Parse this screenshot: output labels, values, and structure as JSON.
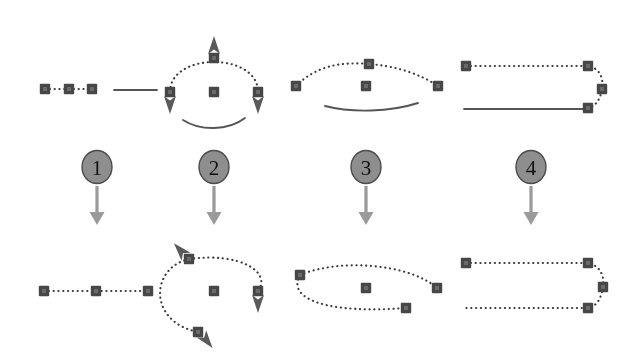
{
  "figure": {
    "type": "diagram",
    "width": 635,
    "height": 353,
    "background": "#ffffff",
    "rows": [
      "before",
      "after"
    ],
    "columns": 4
  },
  "colors": {
    "node": "#474747",
    "node_inner": "#6a6a6a",
    "dotted_path": "#3a3a3a",
    "solid_path": "#555555",
    "arrow": "#9a9a9a",
    "marker_arrow": "#5a5a5a",
    "circle_fill": "#8e8e8e",
    "circle_stroke": "#4b4b4b",
    "number_text": "#111111"
  },
  "steps": [
    {
      "id": "step-1",
      "label": "1",
      "circle": {
        "cx": 97,
        "cy": 167,
        "r": 15
      },
      "arrow": {
        "x": 97,
        "y1": 186,
        "y2": 225
      },
      "before": {
        "description": "three nodes joined by dotted segments plus a separate solid segment",
        "nodes": [
          {
            "x": 45,
            "y": 89
          },
          {
            "x": 69,
            "y": 89
          },
          {
            "x": 92,
            "y": 89
          }
        ],
        "dotted_paths": [
          "M45 89 L92 89"
        ],
        "solid_paths": [
          "M114 90 L157 90"
        ]
      },
      "after": {
        "description": "three nodes joined into one continuous dotted path",
        "nodes": [
          {
            "x": 44,
            "y": 291
          },
          {
            "x": 96,
            "y": 291
          },
          {
            "x": 148,
            "y": 291
          }
        ],
        "dotted_paths": [
          "M44 291 L148 291"
        ],
        "solid_paths": []
      }
    },
    {
      "id": "step-2",
      "label": "2",
      "circle": {
        "cx": 214,
        "cy": 167,
        "r": 15
      },
      "arrow": {
        "x": 214,
        "y1": 186,
        "y2": 225
      },
      "before": {
        "description": "open dotted arc with direction arrows and a separate solid arc below",
        "nodes": [
          {
            "x": 214,
            "y": 58
          },
          {
            "x": 170,
            "y": 92
          },
          {
            "x": 258,
            "y": 92
          },
          {
            "x": 214,
            "y": 92
          }
        ],
        "dotted_paths": [
          "M170 92 C170 52 258 52 258 92"
        ],
        "solid_paths": [
          "M183 120 C200 131 228 131 245 118"
        ],
        "markers": [
          {
            "at": [
              214,
              58
            ],
            "dir": "up"
          },
          {
            "at": [
              170,
              92
            ],
            "dir": "down"
          },
          {
            "at": [
              258,
              92
            ],
            "dir": "down"
          }
        ]
      },
      "after": {
        "description": "segments merged into a near-closed dotted loop",
        "nodes": [
          {
            "x": 189,
            "y": 259
          },
          {
            "x": 258,
            "y": 291
          },
          {
            "x": 198,
            "y": 332
          },
          {
            "x": 214,
            "y": 291
          }
        ],
        "dotted_paths": [
          "M189 259 C240 252 272 272 258 291 M189 259 C150 268 148 322 198 332"
        ],
        "solid_paths": [],
        "markers": [
          {
            "at": [
              189,
              259
            ],
            "dir": "upleft"
          },
          {
            "at": [
              258,
              291
            ],
            "dir": "down"
          },
          {
            "at": [
              198,
              332
            ],
            "dir": "downright"
          }
        ]
      }
    },
    {
      "id": "step-3",
      "label": "3",
      "circle": {
        "cx": 366,
        "cy": 167,
        "r": 15
      },
      "arrow": {
        "x": 366,
        "y1": 186,
        "y2": 225
      },
      "before": {
        "description": "dotted arc over a separate solid curve",
        "nodes": [
          {
            "x": 296,
            "y": 86
          },
          {
            "x": 369,
            "y": 64
          },
          {
            "x": 438,
            "y": 86
          },
          {
            "x": 366,
            "y": 86
          }
        ],
        "dotted_paths": [
          "M296 86 C318 64 344 62 369 64 C396 66 420 74 438 86"
        ],
        "solid_paths": [
          "M325 106 C352 113 390 112 418 103"
        ]
      },
      "after": {
        "description": "curves joined into a closed dotted ellipse",
        "nodes": [
          {
            "x": 300,
            "y": 275
          },
          {
            "x": 437,
            "y": 288
          },
          {
            "x": 406,
            "y": 308
          },
          {
            "x": 366,
            "y": 288
          }
        ],
        "dotted_paths": [
          "M300 275 C340 258 410 264 437 288 M300 275 C286 300 330 314 406 308"
        ],
        "solid_paths": []
      }
    },
    {
      "id": "step-4",
      "label": "4",
      "circle": {
        "cx": 531,
        "cy": 167,
        "r": 15
      },
      "arrow": {
        "x": 531,
        "y1": 186,
        "y2": 225
      },
      "before": {
        "description": "dotted path curving around the right with a separate solid bottom line",
        "nodes": [
          {
            "x": 466,
            "y": 66
          },
          {
            "x": 588,
            "y": 66
          },
          {
            "x": 602,
            "y": 89
          },
          {
            "x": 588,
            "y": 108
          }
        ],
        "dotted_paths": [
          "M466 66 L588 66 C600 68 604 79 602 89 C600 100 596 106 588 108"
        ],
        "solid_paths": [
          "M464 109 L588 109"
        ]
      },
      "after": {
        "description": "both lines joined into one continuous dotted U-shaped path",
        "nodes": [
          {
            "x": 466,
            "y": 263
          },
          {
            "x": 588,
            "y": 263
          },
          {
            "x": 603,
            "y": 287
          },
          {
            "x": 588,
            "y": 308
          }
        ],
        "dotted_paths": [
          "M466 263 L588 263 C600 265 605 277 603 287 C601 299 597 306 588 308 L466 308"
        ],
        "solid_paths": []
      }
    }
  ]
}
